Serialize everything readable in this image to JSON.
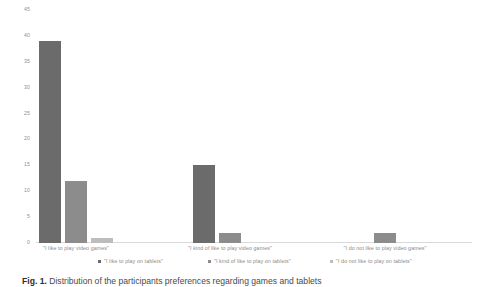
{
  "chart_data": {
    "type": "bar",
    "title": "",
    "xlabel": "",
    "ylabel": "",
    "ylim": [
      0,
      45
    ],
    "yticks": [
      "0",
      "5",
      "10",
      "15",
      "20",
      "25",
      "30",
      "35",
      "40",
      "45"
    ],
    "grid": false,
    "legend_position": "bottom",
    "categories": [
      "\"I like to play video games\"",
      "\"I kind of like to play video games\"",
      "\"I do not like to play video games\""
    ],
    "series": [
      {
        "name": "\"I like to play on tablets\"",
        "color": "#6b6b6b",
        "values": [
          39,
          15,
          0
        ]
      },
      {
        "name": "\"I kind of like to play on tablets\"",
        "color": "#8c8c8c",
        "values": [
          12,
          2,
          2
        ]
      },
      {
        "name": "\"I do not like to play on tablets\"",
        "color": "#bdbdbd",
        "values": [
          1,
          0,
          0
        ]
      }
    ]
  },
  "caption": {
    "prefix": "Fig. 1.",
    "text": "Distribution of the participants preferences regarding games and tablets"
  }
}
